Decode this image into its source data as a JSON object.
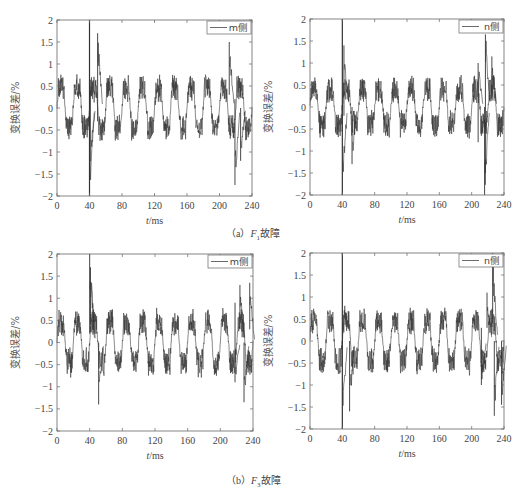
{
  "figure": {
    "captions": [
      {
        "prefix": "（a）",
        "var": "F",
        "sub": "1",
        "suffix": "故障"
      },
      {
        "prefix": "（b）",
        "var": "F",
        "sub": "3",
        "suffix": "故障"
      }
    ]
  },
  "chart_data": [
    {
      "type": "line",
      "panel": "a-left",
      "title": "",
      "xlabel": "t/ms",
      "ylabel": "变换误差/%",
      "xlim": [
        0,
        240
      ],
      "ylim": [
        -2,
        2
      ],
      "xticks": [
        0,
        40,
        80,
        120,
        160,
        200,
        240
      ],
      "yticks": [
        2,
        1.5,
        1,
        0.5,
        0,
        -0.5,
        -1,
        -1.5,
        -2
      ],
      "ytick_labels": [
        "2",
        "1.5",
        "1",
        "0.5",
        "0",
        "−0.5",
        "−1",
        "−1.5",
        "−2"
      ],
      "grid": false,
      "legend": {
        "position": "upper right",
        "entries": [
          "m侧"
        ]
      },
      "series": [
        {
          "name": "m侧",
          "description": "alternating ±0.5 square-like wave (period ~20 ms, amplitude ~0.8 peak) with high-frequency ripple",
          "period_ms": 20,
          "level": 0.45,
          "ripple": 0.3,
          "events": [
            {
              "t": 40,
              "min": -2,
              "max": 2
            },
            {
              "t": 41,
              "min": -1.2,
              "max": 0.4
            },
            {
              "t": 50,
              "min": -0.3,
              "max": 1.7
            },
            {
              "t": 212,
              "min": 0.3,
              "max": 1.5
            },
            {
              "t": 219,
              "min": -1.75,
              "max": 0.2
            },
            {
              "t": 226,
              "min": -1.2,
              "max": 0
            }
          ]
        }
      ]
    },
    {
      "type": "line",
      "panel": "a-right",
      "xlabel": "t/ms",
      "ylabel": "变换误差/%",
      "xlim": [
        0,
        240
      ],
      "ylim": [
        -2,
        2
      ],
      "xticks": [
        0,
        40,
        80,
        120,
        160,
        200,
        240
      ],
      "yticks": [
        2,
        1.5,
        1,
        0.5,
        0,
        -0.5,
        -1,
        -1.5,
        -2
      ],
      "ytick_labels": [
        "2",
        "1.5",
        "1",
        "0.5",
        "0",
        "−0.5",
        "−1",
        "−1.5",
        "−2"
      ],
      "grid": false,
      "legend": {
        "position": "upper right",
        "entries": [
          "n侧"
        ]
      },
      "series": [
        {
          "name": "n侧",
          "period_ms": 20,
          "level": 0.4,
          "ripple": 0.3,
          "events": [
            {
              "t": 40,
              "min": -2,
              "max": 2
            },
            {
              "t": 42,
              "min": -0.2,
              "max": 1.4
            },
            {
              "t": 52,
              "min": -1.3,
              "max": 0
            },
            {
              "t": 208,
              "min": -0.8,
              "max": 1.0
            },
            {
              "t": 216,
              "min": -2,
              "max": 0
            },
            {
              "t": 217,
              "min": -1.5,
              "max": 1.65
            },
            {
              "t": 225,
              "min": 0.3,
              "max": 1.15
            }
          ]
        }
      ]
    },
    {
      "type": "line",
      "panel": "b-left",
      "xlabel": "t/ms",
      "ylabel": "变换误差/%",
      "xlim": [
        0,
        240
      ],
      "ylim": [
        -2,
        2
      ],
      "xticks": [
        0,
        40,
        80,
        120,
        160,
        200,
        240
      ],
      "yticks": [
        2,
        1.5,
        1,
        0.5,
        0,
        -0.5,
        -1,
        -1.5,
        -2
      ],
      "ytick_labels": [
        "2",
        "1.5",
        "1",
        "0.5",
        "0",
        "−0.5",
        "−1",
        "−1.5",
        "−2"
      ],
      "grid": false,
      "legend": {
        "position": "upper right",
        "entries": [
          "m侧"
        ]
      },
      "series": [
        {
          "name": "m侧",
          "period_ms": 20,
          "level": 0.45,
          "ripple": 0.3,
          "events": [
            {
              "t": 40,
              "min": 0.2,
              "max": 2
            },
            {
              "t": 41,
              "min": 0.4,
              "max": 1.7
            },
            {
              "t": 51,
              "min": -1.4,
              "max": 0
            },
            {
              "t": 218,
              "min": -0.9,
              "max": 0.9
            },
            {
              "t": 224,
              "min": 0.3,
              "max": 1.3
            },
            {
              "t": 229,
              "min": -1.35,
              "max": 0
            },
            {
              "t": 236,
              "min": 0.3,
              "max": 1.35
            }
          ]
        }
      ]
    },
    {
      "type": "line",
      "panel": "b-right",
      "xlabel": "t/ms",
      "ylabel": "变换误差/%",
      "xlim": [
        0,
        240
      ],
      "ylim": [
        -2,
        2
      ],
      "xticks": [
        0,
        40,
        80,
        120,
        160,
        200,
        240
      ],
      "yticks": [
        2,
        1.5,
        1,
        0.5,
        0,
        -0.5,
        -1,
        -1.5,
        -2
      ],
      "ytick_labels": [
        "2",
        "1.5",
        "1",
        "0.5",
        "0",
        "−0.5",
        "−1",
        "−1.5",
        "−2"
      ],
      "grid": false,
      "legend": {
        "position": "upper right",
        "entries": [
          "n侧"
        ]
      },
      "series": [
        {
          "name": "n侧",
          "period_ms": 20,
          "level": 0.45,
          "ripple": 0.3,
          "events": [
            {
              "t": 40,
              "min": -2,
              "max": 2
            },
            {
              "t": 49,
              "min": -1.6,
              "max": 0
            },
            {
              "t": 212,
              "min": -1.0,
              "max": 0.3
            },
            {
              "t": 219,
              "min": 0.3,
              "max": 1.1
            },
            {
              "t": 226,
              "min": 0.5,
              "max": 2
            },
            {
              "t": 228,
              "min": -1.7,
              "max": 0
            },
            {
              "t": 237,
              "min": -1.45,
              "max": 0
            }
          ]
        }
      ]
    }
  ]
}
